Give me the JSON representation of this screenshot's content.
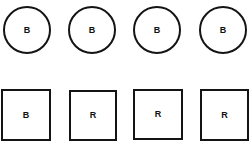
{
  "canvas": {
    "width": 250,
    "height": 147,
    "background_color": "#ffffff",
    "outline_color": "#141414",
    "text_color": "#111111"
  },
  "rows": [
    {
      "name": "circles-row",
      "shape_type": "circle",
      "items": [
        {
          "label": "B",
          "x": 3,
          "y": 6,
          "width": 48,
          "height": 48
        },
        {
          "label": "B",
          "x": 68,
          "y": 6,
          "width": 48,
          "height": 48
        },
        {
          "label": "B",
          "x": 133,
          "y": 6,
          "width": 48,
          "height": 48
        },
        {
          "label": "B",
          "x": 199,
          "y": 6,
          "width": 48,
          "height": 48
        }
      ]
    },
    {
      "name": "squares-row",
      "shape_type": "square",
      "items": [
        {
          "label": "B",
          "x": 1,
          "y": 89,
          "width": 50,
          "height": 52
        },
        {
          "label": "R",
          "x": 69,
          "y": 90,
          "width": 48,
          "height": 51
        },
        {
          "label": "R",
          "x": 133,
          "y": 89,
          "width": 50,
          "height": 51
        },
        {
          "label": "R",
          "x": 200,
          "y": 89,
          "width": 49,
          "height": 52
        }
      ]
    }
  ]
}
